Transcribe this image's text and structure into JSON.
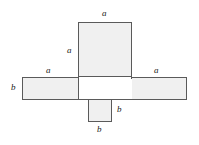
{
  "diagram": {
    "type": "geometric-net",
    "fill_color": "#f0f0f0",
    "stroke_color": "#5a5a5a",
    "background_color": "#ffffff",
    "labels": {
      "top_face_width": "a",
      "top_face_height": "a",
      "left_face_width": "a",
      "left_face_height": "b",
      "right_face_width": "a",
      "bottom_face_height": "b",
      "bottom_face_width": "b"
    },
    "faces": [
      {
        "name": "top-rectangle",
        "x": 78,
        "y": 22,
        "width": 54,
        "height": 55
      },
      {
        "name": "left-rectangle",
        "x": 22,
        "y": 77,
        "width": 56,
        "height": 22
      },
      {
        "name": "right-rectangle",
        "x": 132,
        "y": 77,
        "width": 55,
        "height": 22
      },
      {
        "name": "center-rectangle",
        "x": 78,
        "y": 77,
        "width": 54,
        "height": 22
      },
      {
        "name": "bottom-square",
        "x": 88,
        "y": 99,
        "width": 23,
        "height": 22
      }
    ]
  }
}
